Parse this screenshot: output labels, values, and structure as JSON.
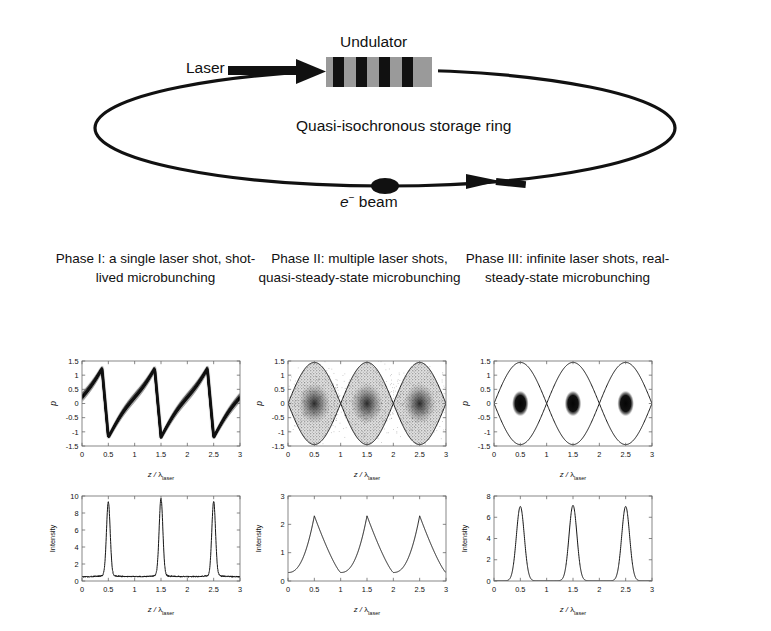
{
  "schematic": {
    "undulator_label": "Undulator",
    "laser_label": "Laser",
    "ring_label": "Quasi-isochronous storage ring",
    "ebeam_label_e": "e",
    "ebeam_label_sup": "−",
    "ebeam_label_rest": " beam",
    "undulator_bars": 4,
    "colors": {
      "line": "#111111",
      "undulator_body": "#9a9a9a",
      "undulator_bar": "#111111"
    }
  },
  "captions": [
    "Phase I: a single laser shot, shot-lived microbunching",
    "Phase II: multiple laser shots, quasi-steady-state microbunching",
    "Phase III: infinite laser shots, real-steady-state microbunching"
  ],
  "axis_text": {
    "xlabel_z": "z / ",
    "xlabel_lambda": "λ",
    "xlabel_sub": "laser",
    "ylabel_p": "p",
    "ylabel_intensity": "Intensity"
  },
  "chart_data": [
    {
      "id": "phase1-phasespace",
      "type": "scatter",
      "title": "Phase I phase space",
      "xlabel": "z / λ_laser",
      "ylabel": "p",
      "xlim": [
        0,
        3
      ],
      "ylim": [
        -1.5,
        1.5
      ],
      "xticks": [
        0,
        0.5,
        1,
        1.5,
        2,
        2.5,
        3
      ],
      "xticklabels": [
        "0",
        "0.5",
        "1",
        "1.5",
        "2",
        "2.5",
        "3"
      ],
      "yticks": [
        -1.5,
        -1,
        -0.5,
        0,
        0.5,
        1,
        1.5
      ],
      "yticklabels": [
        "-1.5",
        "-1",
        "-0.5",
        "0",
        "0.5",
        "1",
        "1.5"
      ],
      "grid": false,
      "description": "Dense sawtooth-shaped filament: p rises roughly linearly from -1.2 to +1.3 across each period then drops steeply back, period 1 in z, turning points at z = 0.5, 1.5, 2.5",
      "series": [
        {
          "name": "sawtooth filament",
          "period": 1.0,
          "peak_p": 1.3,
          "trough_p": -1.2,
          "turning_points_z": [
            0.5,
            1.5,
            2.5
          ],
          "render": "sawtooth-filament"
        }
      ]
    },
    {
      "id": "phase2-phasespace",
      "type": "scatter",
      "title": "Phase II phase space",
      "xlabel": "z / λ_laser",
      "ylabel": "p",
      "xlim": [
        0,
        3
      ],
      "ylim": [
        -1.5,
        1.5
      ],
      "xticks": [
        0,
        0.5,
        1,
        1.5,
        2,
        2.5,
        3
      ],
      "xticklabels": [
        "0",
        "0.5",
        "1",
        "1.5",
        "2",
        "2.5",
        "3"
      ],
      "yticks": [
        -1.5,
        -1,
        -0.5,
        0,
        0.5,
        1,
        1.5
      ],
      "yticklabels": [
        "-1.5",
        "-1",
        "-0.5",
        "0",
        "0.5",
        "1",
        "1.5"
      ],
      "grid": false,
      "description": "Three separatrix 'eye' buckets centred at z = 0.5, 1.5, 2.5 reaching p = +/-1.45, entirely filled with gray speckle and a darker diffuse core at each bucket centre",
      "series": [
        {
          "name": "separatrix",
          "bucket_centers_z": [
            0.5,
            1.5,
            2.5
          ],
          "bucket_half_height_p": 1.45,
          "render": "separatrix-curve"
        },
        {
          "name": "filled speckle",
          "fill": "gray-speckle",
          "core_darkness": 0.85,
          "core_radius_z": 0.22,
          "core_radius_p": 0.55,
          "render": "speckle-fill"
        }
      ]
    },
    {
      "id": "phase3-phasespace",
      "type": "scatter",
      "title": "Phase III phase space",
      "xlabel": "z / λ_laser",
      "ylabel": "p",
      "xlim": [
        0,
        3
      ],
      "ylim": [
        -1.5,
        1.5
      ],
      "xticks": [
        0,
        0.5,
        1,
        1.5,
        2,
        2.5,
        3
      ],
      "xticklabels": [
        "0",
        "0.5",
        "1",
        "1.5",
        "2",
        "2.5",
        "3"
      ],
      "yticks": [
        -1.5,
        -1,
        -0.5,
        0,
        0.5,
        1,
        1.5
      ],
      "yticklabels": [
        "-1.5",
        "-1",
        "-0.5",
        "0",
        "0.5",
        "1",
        "1.5"
      ],
      "grid": false,
      "description": "Three empty separatrix 'eye' buckets centred at z = 0.5, 1.5, 2.5 reaching p = +/-1.45, each containing a single compact round black blob at its centre",
      "series": [
        {
          "name": "separatrix",
          "bucket_centers_z": [
            0.5,
            1.5,
            2.5
          ],
          "bucket_half_height_p": 1.45,
          "render": "separatrix-curve"
        },
        {
          "name": "microbunch blobs",
          "blob_centers_z": [
            0.5,
            1.5,
            2.5
          ],
          "blob_center_p": 0,
          "blob_radius_z": 0.14,
          "blob_radius_p": 0.42,
          "render": "dark-blob"
        }
      ]
    },
    {
      "id": "phase1-intensity",
      "type": "line",
      "title": "Phase I intensity",
      "xlabel": "z / λ_laser",
      "ylabel": "Intensity",
      "xlim": [
        0,
        3
      ],
      "ylim": [
        0,
        10
      ],
      "xticks": [
        0,
        0.5,
        1,
        1.5,
        2,
        2.5,
        3
      ],
      "xticklabels": [
        "0",
        "0.5",
        "1",
        "1.5",
        "2",
        "2.5",
        "3"
      ],
      "yticks": [
        0,
        2,
        4,
        6,
        8,
        10
      ],
      "yticklabels": [
        "0",
        "2",
        "4",
        "6",
        "8",
        "10"
      ],
      "grid": false,
      "description": "Three very narrow spikes on a low noisy baseline",
      "baseline": 0.5,
      "peaks": [
        {
          "z": 0.5,
          "height": 8.5,
          "width": 0.035
        },
        {
          "z": 1.5,
          "height": 8.9,
          "width": 0.035
        },
        {
          "z": 2.5,
          "height": 8.6,
          "width": 0.035
        }
      ]
    },
    {
      "id": "phase2-intensity",
      "type": "line",
      "title": "Phase II intensity",
      "xlabel": "z / λ_laser",
      "ylabel": "Intensity",
      "xlim": [
        0,
        3
      ],
      "ylim": [
        0,
        3
      ],
      "xticks": [
        0,
        0.5,
        1,
        1.5,
        2,
        2.5,
        3
      ],
      "xticklabels": [
        "0",
        "0.5",
        "1",
        "1.5",
        "2",
        "2.5",
        "3"
      ],
      "yticks": [
        0,
        1,
        2,
        3
      ],
      "yticklabels": [
        "0",
        "1",
        "2",
        "3"
      ],
      "grid": false,
      "description": "Three broad asymmetric peaks rising gradually to a sharp tip then falling, minima near 0.3",
      "baseline": 0.3,
      "peaks": [
        {
          "z": 0.5,
          "height": 2.3,
          "width": 0.4
        },
        {
          "z": 1.5,
          "height": 2.3,
          "width": 0.4
        },
        {
          "z": 2.5,
          "height": 2.32,
          "width": 0.4
        }
      ]
    },
    {
      "id": "phase3-intensity",
      "type": "line",
      "title": "Phase III intensity",
      "xlabel": "z / λ_laser",
      "ylabel": "Intensity",
      "xlim": [
        0,
        3
      ],
      "ylim": [
        0,
        8
      ],
      "xticks": [
        0,
        0.5,
        1,
        1.5,
        2,
        2.5,
        3
      ],
      "xticklabels": [
        "0",
        "0.5",
        "1",
        "1.5",
        "2",
        "2.5",
        "3"
      ],
      "yticks": [
        0,
        2,
        4,
        6,
        8
      ],
      "yticklabels": [
        "0",
        "2",
        "4",
        "6",
        "8"
      ],
      "grid": false,
      "description": "Three narrow symmetric Gaussian peaks of height about 7 on a flat near-zero baseline",
      "baseline": 0.02,
      "peaks": [
        {
          "z": 0.5,
          "height": 7.0,
          "width": 0.075
        },
        {
          "z": 1.5,
          "height": 7.1,
          "width": 0.075
        },
        {
          "z": 2.5,
          "height": 7.0,
          "width": 0.075
        }
      ]
    }
  ]
}
